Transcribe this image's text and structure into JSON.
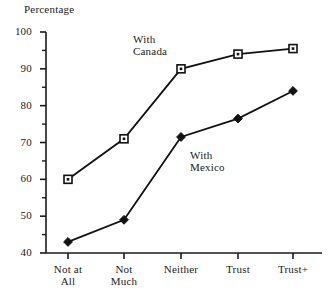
{
  "chart_data": {
    "type": "line",
    "title": "",
    "ylabel": "Percentage",
    "xlabel": "",
    "ylim": [
      40,
      100
    ],
    "ytick_labels": [
      "100",
      "90",
      "80",
      "70",
      "60",
      "50",
      "40"
    ],
    "ytick_values": [
      100,
      90,
      80,
      70,
      60,
      50,
      40
    ],
    "yminor_step": 5,
    "grid": false,
    "legend_position": "inline-annotations",
    "categories": [
      "Not at All",
      "Not Much",
      "Neither",
      "Trust",
      "Trust+"
    ],
    "category_lines": [
      [
        "Not at",
        "All"
      ],
      [
        "Not",
        "Much"
      ],
      [
        "Neither"
      ],
      [
        "Trust"
      ],
      [
        "Trust+"
      ]
    ],
    "series": [
      {
        "name": "With Canada",
        "label_lines": [
          "With",
          "Canada"
        ],
        "marker": "open-square",
        "color": "#111111",
        "values": [
          60,
          71,
          90,
          94,
          95.5
        ]
      },
      {
        "name": "With Mexico",
        "label_lines": [
          "With",
          "Mexico"
        ],
        "marker": "filled-diamond",
        "color": "#111111",
        "values": [
          43,
          49,
          71.5,
          76.5,
          84
        ]
      }
    ]
  },
  "annotations": {
    "canada": {
      "line1": "With",
      "line2": "Canada"
    },
    "mexico": {
      "line1": "With",
      "line2": "Mexico"
    }
  },
  "colors": {
    "axis": "#1a1a1a",
    "series": "#111111",
    "background": "#ffffff"
  }
}
